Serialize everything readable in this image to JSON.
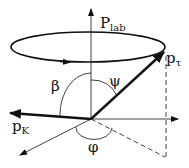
{
  "diagram": {
    "labels": {
      "p_lab": "P",
      "p_lab_sub": "lab",
      "p_tau": "p",
      "p_tau_sub": "τ",
      "p_k": "p",
      "p_k_sub": "K",
      "beta": "β",
      "psi": "ψ",
      "phi": "φ"
    },
    "colors": {
      "stroke": "#111111",
      "background": "#ffffff"
    }
  }
}
